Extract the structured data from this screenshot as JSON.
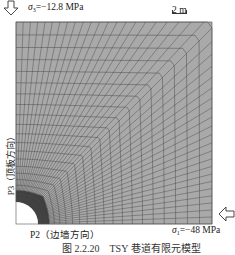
{
  "figure": {
    "top_load": {
      "symbol": "σ",
      "subscript": "3",
      "value": "=−12.8 MPa",
      "arrow_icon": "down-arrow"
    },
    "right_load": {
      "symbol": "σ",
      "subscript": "1",
      "value": "=−48 MPa",
      "arrow_icon": "left-arrow"
    },
    "scale_bar": {
      "label": "2 m"
    },
    "left_axis_label": "P3（顶板方向）",
    "bottom_axis_label": "P2（边墙方向）",
    "caption": "图 2.2.20　TSY 巷道有限元模型",
    "colors": {
      "mesh_fill": "#a9a9a9",
      "mesh_line": "#4a4a4a",
      "dense_zone": "#3c3c3c",
      "hole": "#ffffff"
    },
    "mesh": {
      "x0": 16,
      "y0": 22,
      "x1": 212,
      "y1": 224,
      "hole_radius": 22,
      "radial_lines": 44,
      "rings": 22
    }
  }
}
